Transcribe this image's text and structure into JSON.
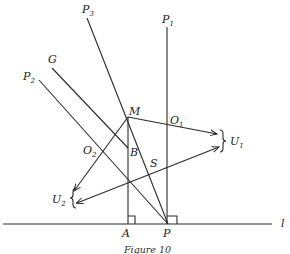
{
  "figure": {
    "caption": "Figure 10",
    "labels": {
      "P3": {
        "main": "P",
        "sub": "3"
      },
      "P1": {
        "main": "P",
        "sub": "1"
      },
      "P2": {
        "main": "P",
        "sub": "2"
      },
      "G": "G",
      "M": "M",
      "O1": {
        "main": "O",
        "sub": "1"
      },
      "O2": {
        "main": "O",
        "sub": "2"
      },
      "B": "B",
      "S": "S",
      "U1": {
        "main": "U",
        "sub": "1"
      },
      "U2": {
        "main": "U",
        "sub": "2"
      },
      "A": "A",
      "P": "P",
      "l": "l"
    },
    "color": "#2a2a2a"
  }
}
